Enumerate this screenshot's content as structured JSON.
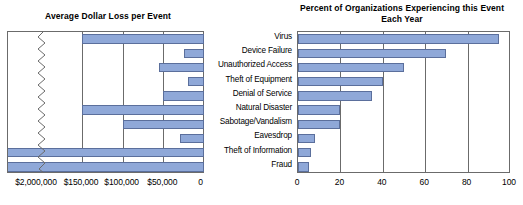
{
  "chart_data": [
    {
      "id": "average-dollar-loss",
      "type": "bar",
      "orientation": "horizontal",
      "title": "Average Dollar Loss per Event",
      "xlabel": "",
      "ylabel": "",
      "direction": "right-to-left",
      "axis_break": true,
      "axis_break_note": "Axis is broken between $150,000 and $2,000,000",
      "tick_labels": [
        "$2,000,000",
        "$150,000",
        "$100,000",
        "$50,000",
        "0"
      ],
      "tick_values": [
        2000000,
        150000,
        100000,
        50000,
        0
      ],
      "categories": [
        "Virus",
        "Device Failure",
        "Unauthorized Access",
        "Theft of Equipment",
        "Denial of Service",
        "Natural Disaster",
        "Sabotage/Vandalism",
        "Eavesdrop",
        "Theft of Information",
        "Fraud"
      ],
      "values": [
        150000,
        25000,
        55000,
        20000,
        50000,
        150000,
        100000,
        30000,
        2000000,
        2000000
      ],
      "grid": true,
      "legend": "none"
    },
    {
      "id": "percent-of-organizations",
      "type": "bar",
      "orientation": "horizontal",
      "title": "Percent of Organizations Experiencing this Event Each Year",
      "xlabel": "",
      "ylabel": "",
      "direction": "left-to-right",
      "xlim": [
        0,
        100
      ],
      "tick_labels": [
        "0",
        "20",
        "40",
        "60",
        "80",
        "100"
      ],
      "tick_values": [
        0,
        20,
        40,
        60,
        80,
        100
      ],
      "categories": [
        "Virus",
        "Device Failure",
        "Unauthorized Access",
        "Theft of Equipment",
        "Denial of Service",
        "Natural Disaster",
        "Sabotage/Vandalism",
        "Eavesdrop",
        "Theft of Information",
        "Fraud"
      ],
      "values": [
        95,
        70,
        50,
        40,
        35,
        20,
        20,
        8,
        6,
        5
      ],
      "grid": true,
      "legend": "none"
    }
  ],
  "colors": {
    "bar_fill": "#8fa8d8",
    "bar_border": "#5b6f9c",
    "axis": "#6b6b6b",
    "text": "#000000",
    "background": "#ffffff"
  }
}
